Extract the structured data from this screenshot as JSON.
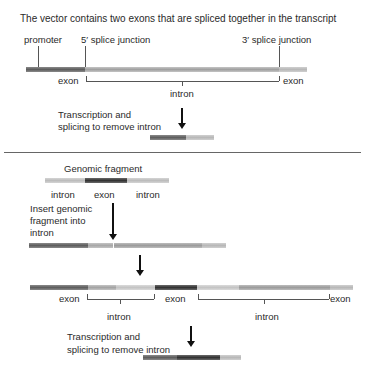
{
  "title": "The vector contains two exons that are spliced together in the transcript",
  "top": {
    "labels": {
      "promoter": "promoter",
      "splice5": "5′ splice junction",
      "splice3": "3′ splice junction",
      "exon_left": "exon",
      "exon_right": "exon",
      "intron": "intron",
      "step": "Transcription and\nsplicing to remove intron",
      "step_line1": "Transcription and",
      "step_line2": "splicing to remove intron"
    }
  },
  "bottom": {
    "fragment_title": "Genomic fragment",
    "fragment_labels": [
      "intron",
      "exon",
      "intron"
    ],
    "insert_line1": "Insert genomic",
    "insert_line2": "fragment into",
    "insert_line3": "intron",
    "result_labels": {
      "exon1": "exon",
      "exon2": "exon",
      "exon3": "exon",
      "intron1": "intron",
      "intron2": "intron"
    },
    "step_line1": "Transcription and",
    "step_line2": "splicing to remove intron"
  },
  "colors": {
    "exon_dark": "#6e6e6e",
    "exon_black": "#3c3c3c",
    "intron_mid": "#a8a8a8",
    "intron_light": "#c8c8c8"
  }
}
